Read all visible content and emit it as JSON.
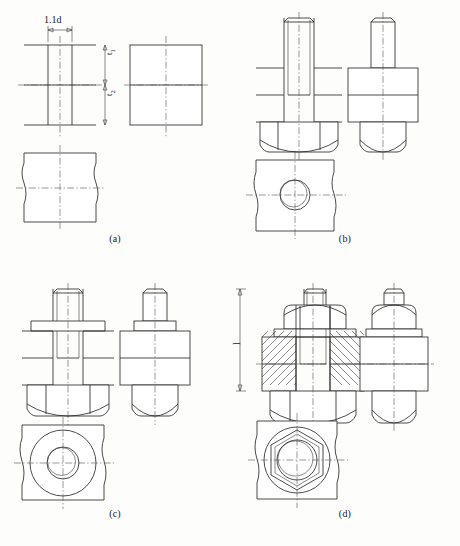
{
  "figure": {
    "type": "engineering-orthographic-drawing",
    "background_color": "#fdfdfb",
    "line_color": "#2b2b2b",
    "centerline_color": "#555555",
    "sheet": {
      "width": 460,
      "height": 546
    }
  },
  "panels": [
    {
      "id": "a",
      "caption": "(a)",
      "description": "Plate with drilled and tapped hole - three views, no fastener",
      "views": [
        "front-section",
        "side",
        "top"
      ],
      "dimensions": [
        {
          "name": "hole-diameter",
          "label": "1.1d",
          "orientation": "horizontal"
        },
        {
          "name": "upper-plate-thickness",
          "label": "t",
          "subscript": "1",
          "orientation": "vertical"
        },
        {
          "name": "lower-plate-thickness",
          "label": "t",
          "subscript": "2",
          "orientation": "vertical"
        }
      ]
    },
    {
      "id": "b",
      "caption": "(b)",
      "description": "Stud bolt screwed into the tapped hole - three views",
      "views": [
        "front-section",
        "side",
        "top"
      ]
    },
    {
      "id": "c",
      "caption": "(c)",
      "description": "Washer added over the stud - three views",
      "views": [
        "front-section",
        "side",
        "top"
      ]
    },
    {
      "id": "d",
      "caption": "(d)",
      "description": "Nut tightened, section hatching shown, overall stud length dimensioned",
      "views": [
        "front-section",
        "side",
        "top"
      ],
      "dimensions": [
        {
          "name": "stud-length",
          "label": "l",
          "orientation": "vertical"
        }
      ]
    }
  ],
  "labels": {
    "hole_diameter": "1.1d",
    "t1_base": "t",
    "t1_sub": "1",
    "t2_base": "t",
    "t2_sub": "2",
    "stud_length": "l",
    "caption_a": "(a)",
    "caption_b": "(b)",
    "caption_c": "(c)",
    "caption_d": "(d)"
  }
}
